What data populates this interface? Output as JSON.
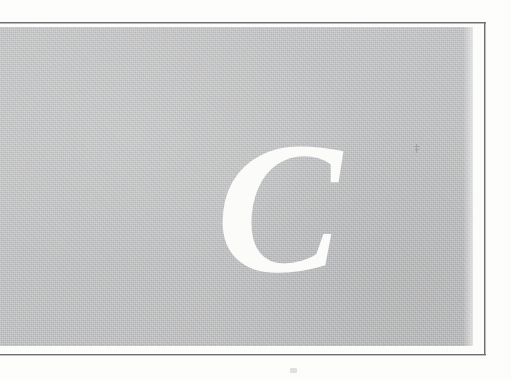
{
  "document": {
    "kind": "scanned-book-page",
    "caption": "Scanned page: large white italic drop cap on a grey screened panel",
    "page_background_color": "#fdfdfc",
    "rule_color": "#6f7073"
  },
  "panel": {
    "name": "grey-illustration-panel",
    "fill_color": "#c2c3c4",
    "texture": "halftone-screen-noise"
  },
  "drop_cap": {
    "character": "C",
    "color": "#fbfbfa",
    "style": "italic-serif-bold"
  },
  "artifacts": {
    "speck_label": "scan-speck",
    "footer_smudge_label": "footer-smudge"
  },
  "rules": {
    "top_label": "top-rule",
    "right_label": "right-rule",
    "bottom_label": "bottom-rule"
  }
}
